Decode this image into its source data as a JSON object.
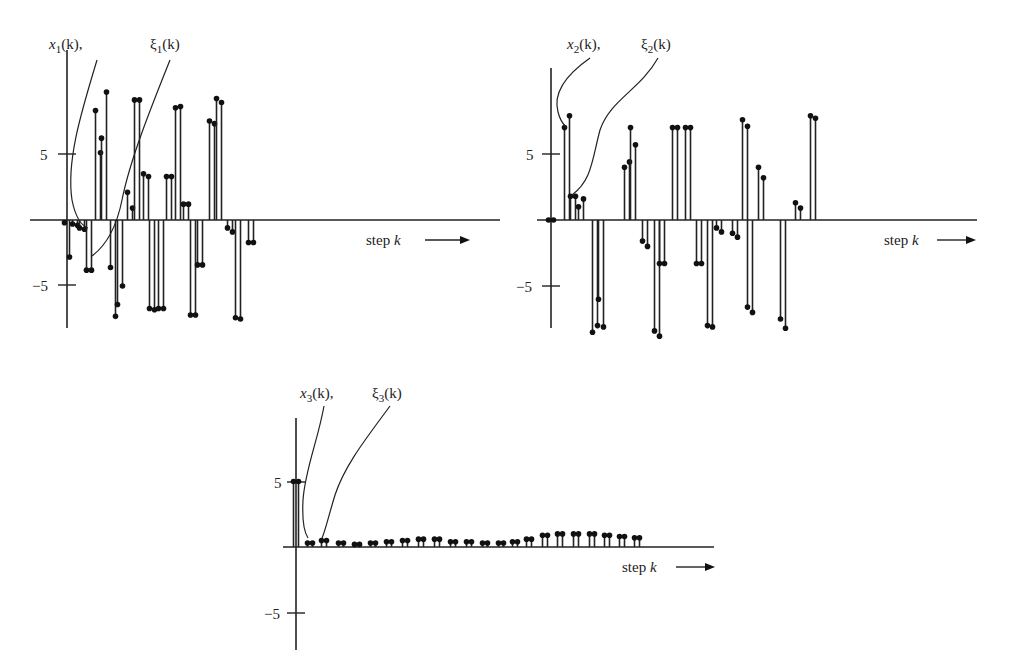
{
  "chart_data": [
    {
      "type": "stem",
      "title": "x1(k), ξ1(k)",
      "series": [
        {
          "name": "x1(k)"
        },
        {
          "name": "ξ1(k)"
        }
      ],
      "xlabel": "step k",
      "ylabel": "",
      "yticks": [
        5,
        -5
      ],
      "ylim": [
        -8,
        10
      ],
      "grid": false,
      "pairs": [
        [
          -0.2,
          -2.8
        ],
        [
          -0.3,
          -0.4
        ],
        [
          -0.6,
          -0.7
        ],
        [
          -3.8,
          -3.8
        ],
        [
          8.3,
          5.1
        ],
        [
          6.2,
          9.7
        ],
        [
          -3.6,
          -7.3
        ],
        [
          -6.4,
          -5.0
        ],
        [
          2.1,
          0.9
        ],
        [
          9.1,
          9.1
        ],
        [
          3.5,
          3.3
        ],
        [
          -6.7,
          -6.8
        ],
        [
          -6.7,
          -6.7
        ],
        [
          3.3,
          3.3
        ],
        [
          8.5,
          8.6
        ],
        [
          1.2,
          1.2
        ],
        [
          -7.2,
          -7.2
        ],
        [
          -3.4,
          -3.4
        ],
        [
          7.5,
          7.3
        ],
        [
          9.2,
          8.9
        ],
        [
          -0.6,
          -0.9
        ],
        [
          -7.4,
          -7.5
        ],
        [
          -1.7,
          -1.7
        ]
      ],
      "x_positions": [
        67,
        75,
        82,
        89,
        98,
        104,
        113,
        120,
        130,
        137,
        146,
        152,
        161,
        169,
        178,
        186,
        193,
        200,
        212,
        219,
        230,
        238,
        251
      ],
      "lead_lines": [
        "x1(k) label points to k=0..1",
        "ξ1(k) label points to k≈3"
      ]
    },
    {
      "type": "stem",
      "title": "x2(k), ξ2(k)",
      "series": [
        {
          "name": "x2(k)"
        },
        {
          "name": "ξ2(k)"
        }
      ],
      "xlabel": "step k",
      "ylabel": "",
      "yticks": [
        5,
        -5
      ],
      "ylim": [
        -9,
        10
      ],
      "grid": false,
      "pairs": [
        [
          0.0,
          0.0
        ],
        [
          7.0,
          7.9
        ],
        [
          1.8,
          1.8
        ],
        [
          1.0,
          1.6
        ],
        [
          -8.5,
          -8.0
        ],
        [
          -6.0,
          -8.1
        ],
        [
          4.0,
          4.4
        ],
        [
          7.0,
          5.7
        ],
        [
          -1.6,
          -2.0
        ],
        [
          -8.4,
          -8.8
        ],
        [
          -3.3,
          -3.3
        ],
        [
          7.0,
          7.0
        ],
        [
          7.0,
          7.0
        ],
        [
          -3.3,
          -3.3
        ],
        [
          -8.0,
          -8.1
        ],
        [
          -0.6,
          -0.9
        ],
        [
          -1.0,
          -1.3
        ],
        [
          7.6,
          7.1
        ],
        [
          -6.6,
          -7.0
        ],
        [
          4.0,
          3.2
        ],
        [
          -7.5,
          -8.2
        ],
        [
          1.3,
          0.9
        ],
        [
          7.9,
          7.7
        ]
      ],
      "x_positions": [
        551,
        567,
        573,
        581,
        595,
        601,
        627,
        633,
        645,
        657,
        662,
        675,
        688,
        699,
        710,
        719,
        735,
        745,
        750,
        761,
        783,
        798,
        813
      ],
      "lead_lines": [
        "x2(k) label points to k=1",
        "ξ2(k) label points to k=2"
      ]
    },
    {
      "type": "stem",
      "title": "x3(k), ξ3(k)",
      "series": [
        {
          "name": "x3(k)"
        },
        {
          "name": "ξ3(k)"
        }
      ],
      "xlabel": "step k",
      "ylabel": "",
      "yticks": [
        5,
        -5
      ],
      "ylim": [
        -8,
        10
      ],
      "grid": false,
      "pairs": [
        [
          5.0,
          5.0
        ],
        [
          0.3,
          0.3
        ],
        [
          0.5,
          0.5
        ],
        [
          0.3,
          0.3
        ],
        [
          0.2,
          0.2
        ],
        [
          0.3,
          0.3
        ],
        [
          0.4,
          0.4
        ],
        [
          0.5,
          0.5
        ],
        [
          0.6,
          0.6
        ],
        [
          0.6,
          0.6
        ],
        [
          0.4,
          0.4
        ],
        [
          0.4,
          0.4
        ],
        [
          0.3,
          0.3
        ],
        [
          0.3,
          0.3
        ],
        [
          0.4,
          0.4
        ],
        [
          0.6,
          0.6
        ],
        [
          0.9,
          0.9
        ],
        [
          1.0,
          1.0
        ],
        [
          1.0,
          1.0
        ],
        [
          1.0,
          1.0
        ],
        [
          0.9,
          0.9
        ],
        [
          0.8,
          0.8
        ],
        [
          0.7,
          0.7
        ]
      ],
      "x_positions": [
        296,
        310,
        324,
        341,
        357,
        373,
        389,
        405,
        421,
        437,
        453,
        469,
        485,
        501,
        515,
        529,
        545,
        560,
        576,
        592,
        607,
        622,
        637
      ],
      "lead_lines": [
        "x3(k) label points to k=0..1",
        "ξ3(k) label points to k=2"
      ]
    }
  ],
  "labels": {
    "p1": {
      "x": "x",
      "xsub": "1",
      "xi": "ξ",
      "xisub": "1",
      "arg": "(k)",
      "comma": ","
    },
    "p2": {
      "x": "x",
      "xsub": "2",
      "xi": "ξ",
      "xisub": "2",
      "arg": "(k)",
      "comma": ","
    },
    "p3": {
      "x": "x",
      "xsub": "3",
      "xi": "ξ",
      "xisub": "3",
      "arg": "(k)",
      "comma": ","
    },
    "step": "step",
    "k": "k",
    "tick_pos": "5",
    "tick_neg": "−5"
  }
}
